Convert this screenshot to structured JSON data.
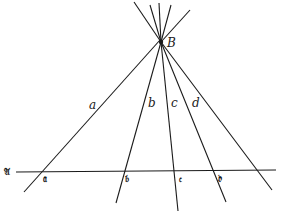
{
  "diagram": {
    "type": "pencil-of-lines-through-point-cut-by-transversal",
    "point": {
      "label": "B",
      "x": 161,
      "y": 42
    },
    "transversal": {
      "label": "𝔄",
      "x1": 16,
      "y1": 172,
      "x2": 276,
      "y2": 170
    },
    "lines": [
      {
        "label": "a",
        "x1": 131,
        "y1": 2,
        "x2": 24,
        "y2": 192,
        "label_x": 90,
        "label_y": 109,
        "intersection_label": "𝔞",
        "ix": 44,
        "iy": 180
      },
      {
        "label": "b",
        "x1": 160,
        "y1": 5,
        "x2": 116,
        "y2": 203,
        "label_x": 149,
        "label_y": 106,
        "intersection_label": "𝔟",
        "ix": 126,
        "iy": 180
      },
      {
        "label": "c",
        "x1": 158,
        "y1": 3,
        "x2": 178,
        "y2": 211,
        "label_x": 172,
        "label_y": 106,
        "intersection_label": "𝔠",
        "ix": 180,
        "iy": 180
      },
      {
        "label": "d",
        "x1": 163,
        "y1": 6,
        "x2": 226,
        "y2": 202,
        "label_x": 193,
        "label_y": 106,
        "intersection_label": "𝔡",
        "ix": 219,
        "iy": 180
      },
      {
        "label": "",
        "x1": 190,
        "y1": 10,
        "x2": 272,
        "y2": 190,
        "label_x": 0,
        "label_y": 0,
        "intersection_label": "",
        "ix": 0,
        "iy": 0
      },
      {
        "label": "",
        "x1": 133,
        "y1": 2,
        "x2": 161,
        "y2": 42,
        "label_x": 0,
        "label_y": 0,
        "intersection_label": "",
        "ix": 0,
        "iy": 0
      }
    ],
    "texts": {
      "B": "B",
      "a": "a",
      "b": "b",
      "c": "c",
      "d": "d",
      "A": "𝔄",
      "fa": "𝔞",
      "fb": "𝔟",
      "fc": "𝔠",
      "fd": "𝔡"
    }
  }
}
